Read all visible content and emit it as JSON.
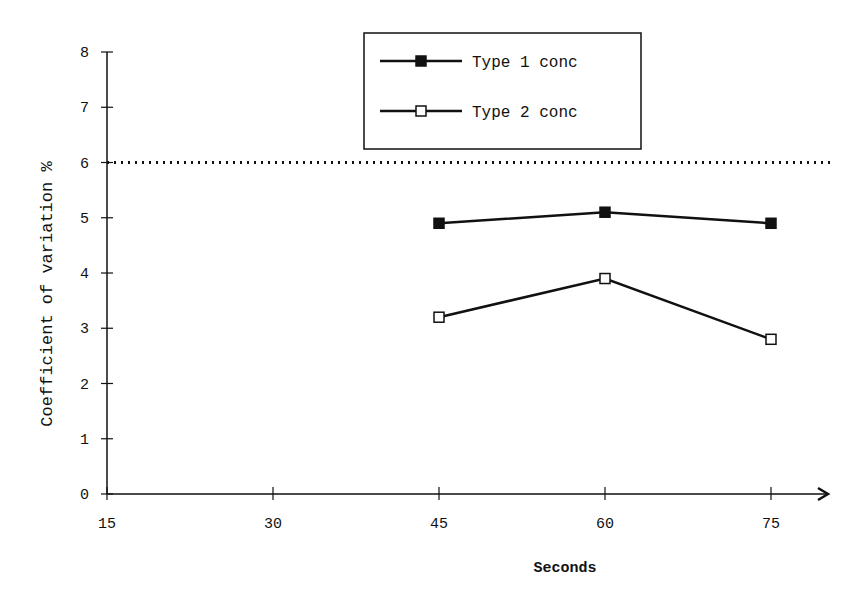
{
  "chart_data": {
    "type": "line",
    "title": "",
    "xlabel": "Seconds",
    "ylabel": "Coefficient of variation  %",
    "x": [
      45,
      60,
      75
    ],
    "x_ticks": [
      15,
      30,
      45,
      60,
      75
    ],
    "y_ticks": [
      0,
      1,
      2,
      3,
      4,
      5,
      6,
      7,
      8
    ],
    "xlim": [
      15,
      80
    ],
    "ylim": [
      0,
      8
    ],
    "grid": false,
    "legend_position": "top-center",
    "reference_line": {
      "y": 6,
      "style": "dotted"
    },
    "series": [
      {
        "name": "Type 1 conc",
        "marker": "filled-square",
        "values": [
          4.9,
          5.1,
          4.9
        ]
      },
      {
        "name": "Type 2 conc",
        "marker": "open-square",
        "values": [
          3.2,
          3.9,
          2.8
        ]
      }
    ]
  }
}
